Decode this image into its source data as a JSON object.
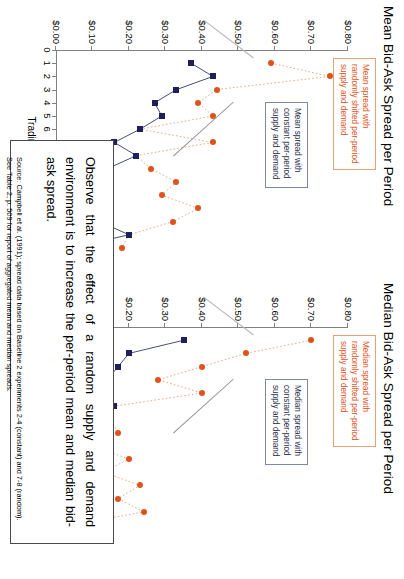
{
  "page": {
    "orientation": "rotated-90-clockwise",
    "background": "#ffffff"
  },
  "colors": {
    "random_series": "#e0521b",
    "constant_series": "#1f1f5c",
    "random_callout_border": "#e8a07a",
    "constant_callout_border": "#7b8aa6",
    "axis": "#808080",
    "note_border": "#4a4a4a"
  },
  "charts": [
    {
      "id": "mean-chart",
      "title": "Mean Bid-Ask Spread per Period",
      "callout_random": "Mean spread with randomly shifted per-period supply and demand",
      "callout_constant": "Mean spread with constant per-period supply and demand"
    },
    {
      "id": "median-chart",
      "title": "Median Bid-Ask Spread per Period",
      "callout_random": "Median spread with randomly shifted per-period supply and demand",
      "callout_constant": "Median spread with constant per-period supply and demand"
    }
  ],
  "note": {
    "body": "Observe that the effect of a random supply and demand environment is to increase the per-period mean and median bid-ask spread.",
    "source_line1": "Source: Campbell et al. (1991); spread data based on Baseline 2 experiments 2-4 (constant) and 7-8 (random).",
    "source_line2": "See Table 2, p. 509 for report of aggregated mean and median spreads."
  },
  "chart_data": [
    {
      "id": "mean-chart",
      "type": "line",
      "title": "Mean Bid-Ask Spread per Period",
      "xlabel": "Trading Period",
      "ylabel": "",
      "x": [
        1,
        2,
        3,
        4,
        5,
        6,
        7,
        8,
        9,
        10,
        11,
        12,
        13,
        14,
        15
      ],
      "xlim": [
        0,
        15
      ],
      "ylim": [
        0.0,
        0.8
      ],
      "ytick_values": [
        0.0,
        0.1,
        0.2,
        0.3,
        0.4,
        0.5,
        0.6,
        0.7,
        0.8
      ],
      "ytick_labels": [
        "$0.00",
        "$0.10",
        "$0.20",
        "$0.30",
        "$0.40",
        "$0.50",
        "$0.60",
        "$0.70",
        "$0.80"
      ],
      "xtick_labels": [
        "0",
        "1",
        "2",
        "3",
        "4",
        "5",
        "6",
        "7",
        "8",
        "9",
        "10",
        "11",
        "12",
        "13",
        "14",
        "15"
      ],
      "grid": false,
      "legend_position": "callout-annotations",
      "series": [
        {
          "name": "Mean spread with randomly shifted per-period supply and demand",
          "style": "dotted",
          "marker": "circle",
          "color": "#e0521b",
          "values": [
            0.59,
            0.75,
            0.44,
            0.39,
            0.43,
            0.23,
            0.43,
            0.22,
            0.26,
            0.33,
            0.29,
            0.39,
            0.32,
            0.2,
            0.18
          ]
        },
        {
          "name": "Mean spread with constant per-period supply and demand",
          "style": "solid",
          "marker": "square",
          "color": "#1f1f5c",
          "values": [
            0.37,
            0.43,
            0.33,
            0.27,
            0.29,
            0.23,
            0.16,
            0.22,
            0.14,
            0.13,
            0.07,
            0.08,
            0.12,
            0.2,
            0.04
          ]
        }
      ]
    },
    {
      "id": "median-chart",
      "type": "line",
      "title": "Median Bid-Ask Spread per Period",
      "xlabel": "Trading Period",
      "ylabel": "",
      "x": [
        1,
        2,
        3,
        4,
        5,
        6,
        7,
        8,
        9,
        10,
        11,
        12,
        13,
        14,
        15
      ],
      "xlim": [
        0,
        15
      ],
      "ylim": [
        0.0,
        0.8
      ],
      "ytick_values": [
        0.0,
        0.1,
        0.2,
        0.3,
        0.4,
        0.5,
        0.6,
        0.7,
        0.8
      ],
      "ytick_labels": [
        "$0.00",
        "$0.10",
        "$0.20",
        "$0.30",
        "$0.40",
        "$0.50",
        "$0.60",
        "$0.70",
        "$0.80"
      ],
      "xtick_labels": [
        "0",
        "1",
        "2",
        "3",
        "4",
        "5",
        "6",
        "7",
        "8",
        "9",
        "10",
        "11",
        "12",
        "13",
        "14",
        "15"
      ],
      "grid": false,
      "legend_position": "callout-annotations",
      "series": [
        {
          "name": "Median spread with randomly shifted per-period supply and demand",
          "style": "dotted",
          "marker": "circle",
          "color": "#e0521b",
          "values": [
            0.7,
            0.52,
            0.4,
            0.28,
            0.4,
            0.16,
            0.15,
            0.17,
            0.1,
            0.2,
            0.13,
            0.23,
            0.17,
            0.24,
            0.05
          ]
        },
        {
          "name": "Median spread with constant per-period supply and demand",
          "style": "solid",
          "marker": "square",
          "color": "#1f1f5c",
          "values": [
            0.35,
            0.2,
            0.17,
            0.14,
            0.13,
            0.16,
            0.1,
            0.12,
            0.15,
            0.07,
            0.05,
            0.06,
            0.07,
            0.05,
            0.05
          ]
        }
      ]
    }
  ]
}
